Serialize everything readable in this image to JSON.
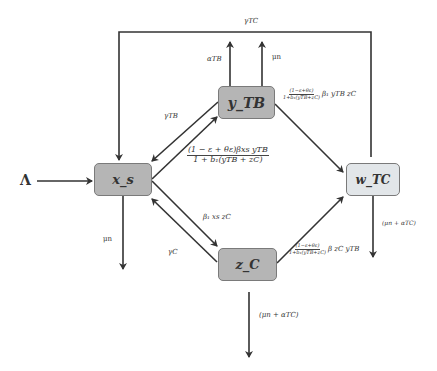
{
  "diagram": {
    "type": "compartmental-model-flow",
    "nodes": [
      {
        "id": "x_s",
        "label": "x_s",
        "fill": "#b5b5b5"
      },
      {
        "id": "y_TB",
        "label": "y_TB",
        "fill": "#b5b5b5"
      },
      {
        "id": "z_C",
        "label": "z_C",
        "fill": "#b5b5b5"
      },
      {
        "id": "w_TC",
        "label": "w_TC",
        "fill": "#e2e6e9"
      }
    ],
    "labels": {
      "lambda": "Λ",
      "gamma_tc": "γTC",
      "alpha_tb": "αTB",
      "mu_n_top": "μn",
      "gamma_tb": "γTB",
      "mu_n_left": "μn",
      "gamma_c": "γC",
      "beta_xz": "β₁ xs zC",
      "mu_alpha_tc_w": "(μn + αTC)",
      "mu_alpha_tc_z": "(μn + αTC)",
      "xy_num": "(1 − ε + θε)βxs yTB",
      "xy_den": "1 + b₁(yTB + zC)",
      "yw_num": "(1−ε+θε)",
      "yw_den": "1+b₁(yTB+zC)",
      "yw_tail": "β₁ yTB  zC",
      "zw_num": "(1−ε+θε)",
      "zw_den": "1+b₁(yTB+zC)",
      "zw_tail": "β zC yTB"
    }
  }
}
